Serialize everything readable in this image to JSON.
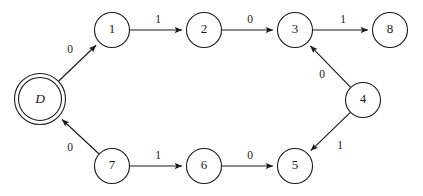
{
  "diagram": {
    "kind": "finite-state-automaton",
    "canvas": {
      "width": 423,
      "height": 196
    },
    "colors": {
      "background": "#ffffff",
      "stroke": "#1a1a1a",
      "node_fill": "#ffffff"
    },
    "nodes": [
      {
        "id": "D",
        "label": "D",
        "x": 40,
        "y": 99,
        "r": 21.5,
        "accepting": true,
        "italic": true,
        "outer_r": 25.5
      },
      {
        "id": "1",
        "label": "1",
        "x": 112,
        "y": 30,
        "r": 17.5,
        "accepting": false,
        "italic": false,
        "outer_r": 17.5
      },
      {
        "id": "2",
        "label": "2",
        "x": 204,
        "y": 30,
        "r": 17.5,
        "accepting": false,
        "italic": false,
        "outer_r": 17.5
      },
      {
        "id": "3",
        "label": "3",
        "x": 295,
        "y": 30,
        "r": 17.5,
        "accepting": false,
        "italic": false,
        "outer_r": 17.5
      },
      {
        "id": "8",
        "label": "8",
        "x": 390,
        "y": 30,
        "r": 17.5,
        "accepting": false,
        "italic": false,
        "outer_r": 17.5
      },
      {
        "id": "4",
        "label": "4",
        "x": 363,
        "y": 100,
        "r": 17.5,
        "accepting": false,
        "italic": false,
        "outer_r": 17.5
      },
      {
        "id": "5",
        "label": "5",
        "x": 295,
        "y": 166,
        "r": 17.5,
        "accepting": false,
        "italic": false,
        "outer_r": 17.5
      },
      {
        "id": "6",
        "label": "6",
        "x": 204,
        "y": 166,
        "r": 17.5,
        "accepting": false,
        "italic": false,
        "outer_r": 17.5
      },
      {
        "id": "7",
        "label": "7",
        "x": 112,
        "y": 166,
        "r": 17.5,
        "accepting": false,
        "italic": false,
        "outer_r": 17.5
      }
    ],
    "edges": [
      {
        "id": "e-D-1",
        "from": "D",
        "to": "1",
        "label": "0",
        "label_x": 70,
        "label_y": 50
      },
      {
        "id": "e-1-2",
        "from": "1",
        "to": "2",
        "label": "1",
        "label_x": 158,
        "label_y": 20
      },
      {
        "id": "e-2-3",
        "from": "2",
        "to": "3",
        "label": "0",
        "label_x": 250,
        "label_y": 20
      },
      {
        "id": "e-3-8",
        "from": "3",
        "to": "8",
        "label": "1",
        "label_x": 343,
        "label_y": 20
      },
      {
        "id": "e-4-3",
        "from": "4",
        "to": "3",
        "label": "0",
        "label_x": 322,
        "label_y": 75
      },
      {
        "id": "e-4-5",
        "from": "4",
        "to": "5",
        "label": "1",
        "label_x": 340,
        "label_y": 146
      },
      {
        "id": "e-7-6",
        "from": "7",
        "to": "6",
        "label": "1",
        "label_x": 158,
        "label_y": 156
      },
      {
        "id": "e-6-5",
        "from": "6",
        "to": "5",
        "label": "0",
        "label_x": 250,
        "label_y": 156
      },
      {
        "id": "e-7-D",
        "from": "7",
        "to": "D",
        "label": "0",
        "label_x": 70,
        "label_y": 148
      }
    ]
  }
}
